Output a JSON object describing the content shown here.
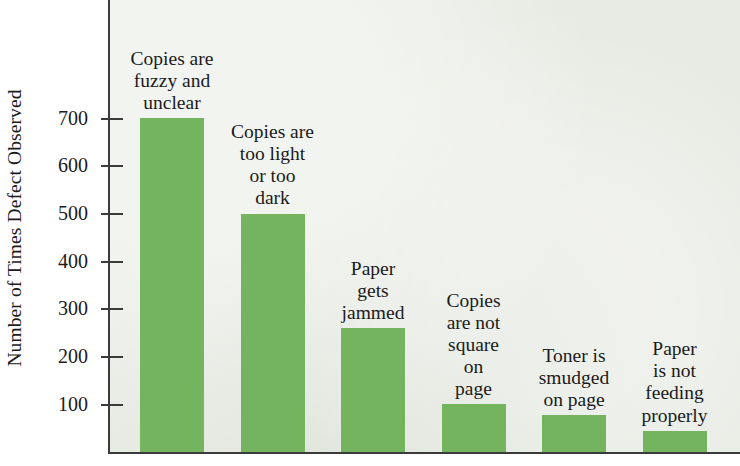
{
  "chart_data": {
    "type": "bar",
    "title": "",
    "subtitle": "",
    "xlabel": "",
    "ylabel": "Number of Times Defect Observed",
    "ylim": [
      0,
      760
    ],
    "yticks": [
      100,
      200,
      300,
      400,
      500,
      600,
      700
    ],
    "ytick_labels": [
      "100",
      "200",
      "300",
      "400",
      "500",
      "600",
      "700"
    ],
    "grid": false,
    "legend": null,
    "bar_color": "#74b45f",
    "plot_background": "#e8ebe4",
    "axis_color": "#3b3b3b",
    "categories": [
      "Copies are fuzzy and unclear",
      "Copies are too light or too dark",
      "Paper gets jammed",
      "Copies are not square on page",
      "Toner is smudged on page",
      "Paper is not feeding properly"
    ],
    "category_lines": [
      [
        "Copies are",
        "fuzzy and",
        "unclear"
      ],
      [
        "Copies are",
        "too light",
        "or too",
        "dark"
      ],
      [
        "Paper",
        "gets",
        "jammed"
      ],
      [
        "Copies",
        "are not",
        "square",
        "on",
        "page"
      ],
      [
        "Toner is",
        "smudged",
        "on page"
      ],
      [
        "Paper",
        "is not",
        "feeding",
        "properly"
      ]
    ],
    "values": [
      700,
      500,
      260,
      100,
      78,
      45
    ]
  }
}
